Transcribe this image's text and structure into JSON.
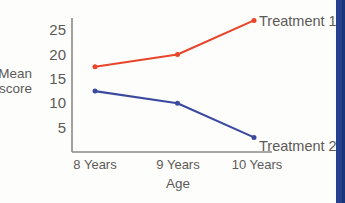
{
  "chart_data": {
    "type": "line",
    "title": "",
    "xlabel": "Age",
    "ylabel": "Mean score",
    "categories": [
      "8 Years",
      "9 Years",
      "10 Years"
    ],
    "x": [
      8,
      9,
      10
    ],
    "yticks": [
      5,
      10,
      15,
      20,
      25
    ],
    "ylim": [
      0,
      27.5
    ],
    "grid": false,
    "legend_position": "right-inline-labels",
    "series": [
      {
        "name": "Treatment 1",
        "color": "#e8452a",
        "values": [
          17.5,
          20.0,
          27.0
        ]
      },
      {
        "name": "Treatment 2",
        "color": "#3b4a9e",
        "values": [
          12.5,
          10.0,
          3.0
        ]
      }
    ]
  },
  "axis": {
    "y_label_line1": "Mean",
    "y_label_line2": "score",
    "x_title": "Age",
    "ytick_labels": [
      "25",
      "20",
      "15",
      "10",
      "5"
    ],
    "xtick_labels": [
      "8 Years",
      "9 Years",
      "10 Years"
    ]
  },
  "labels": {
    "series1": "Treatment 1",
    "series2": "Treatment 2"
  },
  "colors": {
    "series1": "#e8452a",
    "series2": "#3b4a9e",
    "axis": "#7a7a78",
    "text": "#5c5a58",
    "background": "#fdfdfb",
    "right_bar": "#24408e"
  }
}
